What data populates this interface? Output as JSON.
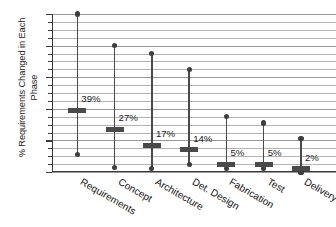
{
  "chart_data": {
    "type": "bar",
    "title": "",
    "subtitle": "",
    "xlabel": "",
    "ylabel": "% Requirements Changed in Each\nPhase",
    "ylim": [
      0,
      100
    ],
    "yticks": [
      0,
      20,
      40,
      60,
      80,
      100
    ],
    "ytick_labels": [
      "0",
      "20",
      "40",
      "60",
      "80",
      "100"
    ],
    "minor_tick_step": 5,
    "grid": true,
    "grid_axis": "y",
    "legend": "none",
    "categories": [
      "Requirements",
      "Concept",
      "Architecture",
      "Det. Design",
      "Fabrication",
      "Test",
      "Delivery"
    ],
    "series": [
      {
        "name": "Maximum",
        "values": [
          100,
          80,
          75,
          65,
          35,
          31,
          21
        ]
      },
      {
        "name": "Median",
        "values": [
          39,
          27,
          17,
          14,
          5,
          5,
          2
        ]
      },
      {
        "name": "Minimum",
        "values": [
          11,
          3,
          2,
          5,
          2,
          2,
          0
        ]
      }
    ],
    "annotations": [
      "39%",
      "27%",
      "17%",
      "14%",
      "5%",
      "5%",
      "2%"
    ],
    "colors": {
      "stem": "#4a4a4a",
      "marker": "#3d3d3d",
      "median_bar": "#4a4a4a",
      "gridline": "#b4b4b4",
      "axis": "#3a3a3a",
      "text": "#141414",
      "background": "#ffffff"
    }
  },
  "axis": {
    "y_title": "% Requirements Changed in Each\nPhase"
  }
}
